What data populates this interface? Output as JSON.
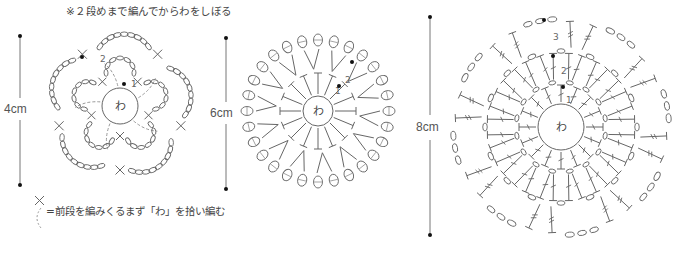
{
  "notes": {
    "top": "※２段めまで編んでからわをしぼる",
    "legend": "=前段を編みくるまず「わ」を拾い編む"
  },
  "legend": {
    "symbol": "single-crochet-x-with-dashed-tail"
  },
  "motifs": [
    {
      "name": "flower-motif",
      "size_label": "4cm",
      "center_label": "わ",
      "round_labels": [
        "1",
        "2"
      ],
      "petals": 5
    },
    {
      "name": "round-motif-medium",
      "size_label": "6cm",
      "center_label": "わ",
      "round_labels": [
        "1",
        "2"
      ],
      "stitches_round1": 16,
      "picots_round2": 28
    },
    {
      "name": "round-motif-large",
      "size_label": "8cm",
      "center_label": "わ",
      "round_labels": [
        "1",
        "2",
        "3"
      ],
      "rounds": 3
    }
  ],
  "colors": {
    "line": "#666666",
    "dashed": "#999999",
    "text": "#444444",
    "dot": "#111111"
  }
}
